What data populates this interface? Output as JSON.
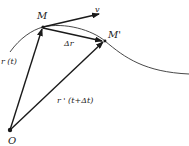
{
  "diagram": {
    "points": {
      "origin": {
        "label": "O",
        "x": 10,
        "y": 130
      },
      "M": {
        "label": "M",
        "x": 43,
        "y": 27
      },
      "M_prime": {
        "label": "M'",
        "x": 105,
        "y": 41
      }
    },
    "vectors": {
      "r_t": {
        "label": "r (t)"
      },
      "r_t_dt": {
        "label": "r ' (t+Δt)"
      },
      "delta_r": {
        "label": "Δr"
      },
      "velocity": {
        "label": "v"
      }
    },
    "colors": {
      "stroke": "#1a1a1a",
      "background": "#ffffff"
    }
  }
}
